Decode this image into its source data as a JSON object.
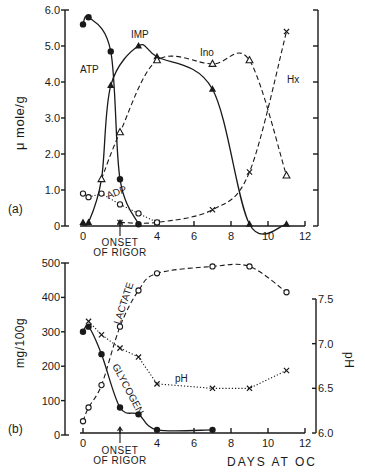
{
  "chart_data": [
    {
      "id": "a",
      "panel_label": "(a)",
      "type": "line",
      "xlabel": "",
      "ylabel": "μ mole/g",
      "xlim": [
        0,
        12
      ],
      "ylim": [
        0,
        6.0
      ],
      "x_ticks": [
        "0",
        "4",
        "6",
        "8",
        "10",
        "12"
      ],
      "y_ticks": [
        "0",
        "1.0",
        "2.0",
        "3.0",
        "4.0",
        "5.0",
        "6.0"
      ],
      "annotations": [
        {
          "text": "ONSET OF RIGOR",
          "x": 2
        }
      ],
      "series": [
        {
          "name": "ATP",
          "marker": "filled-circle",
          "line": "solid",
          "x": [
            0,
            0.3,
            1.5,
            2,
            3
          ],
          "y": [
            5.6,
            5.8,
            4.85,
            1.3,
            0.05
          ]
        },
        {
          "name": "IMP",
          "marker": "filled-triangle",
          "line": "solid",
          "x": [
            0,
            0.3,
            1,
            1.5,
            3,
            4,
            7,
            9,
            11
          ],
          "y": [
            0.1,
            0.1,
            1.3,
            3.9,
            5.0,
            4.7,
            3.8,
            0.05,
            0.05
          ]
        },
        {
          "name": "Ino",
          "marker": "open-triangle",
          "line": "dashed",
          "x": [
            1,
            2,
            4,
            7,
            9,
            11
          ],
          "y": [
            1.3,
            2.6,
            4.6,
            4.5,
            4.6,
            1.4
          ]
        },
        {
          "name": "Hx",
          "marker": "cross",
          "line": "dashed",
          "x": [
            2,
            4,
            7,
            9,
            11
          ],
          "y": [
            0.1,
            0.1,
            0.45,
            1.5,
            5.4
          ]
        },
        {
          "name": "ADP",
          "marker": "open-circle",
          "line": "dotted",
          "x": [
            0,
            0.3,
            1,
            2,
            3,
            4
          ],
          "y": [
            0.9,
            0.8,
            0.9,
            0.6,
            0.35,
            0.1
          ]
        }
      ]
    },
    {
      "id": "b",
      "panel_label": "(b)",
      "type": "line",
      "xlabel": "DAYS AT OC",
      "ylabel": "mg/100g",
      "y2label": "pH",
      "xlim": [
        0,
        12
      ],
      "ylim": [
        0,
        500
      ],
      "y2lim": [
        6.0,
        7.5
      ],
      "x_ticks": [
        "0",
        "4",
        "6",
        "8",
        "10",
        "12"
      ],
      "y_ticks": [
        "0",
        "100",
        "200",
        "300",
        "400",
        "500"
      ],
      "y2_ticks": [
        "6.0",
        "6.5",
        "7.0",
        "7.5"
      ],
      "annotations": [
        {
          "text": "ONSET OF RIGOR",
          "x": 2
        }
      ],
      "series": [
        {
          "name": "LACTATE",
          "marker": "open-circle",
          "line": "dashed",
          "axis": "left",
          "x": [
            0,
            0.3,
            1,
            2,
            3,
            4,
            7,
            9,
            11
          ],
          "y": [
            40,
            80,
            145,
            315,
            420,
            470,
            490,
            490,
            415
          ]
        },
        {
          "name": "GLYCOGEN",
          "marker": "filled-circle",
          "line": "solid",
          "axis": "left",
          "x": [
            0,
            0.3,
            1,
            2,
            3,
            4,
            7
          ],
          "y": [
            300,
            315,
            235,
            80,
            60,
            15,
            15
          ]
        },
        {
          "name": "pH",
          "marker": "cross",
          "line": "dotted",
          "axis": "right",
          "x": [
            0.3,
            1,
            2,
            3,
            4,
            7,
            9,
            11
          ],
          "y": [
            7.25,
            7.1,
            6.95,
            6.85,
            6.55,
            6.5,
            6.5,
            6.7
          ]
        }
      ]
    }
  ],
  "labels": {
    "a_panel": "(a)",
    "b_panel": "(b)",
    "a_ylabel": "μ mole/g",
    "b_ylabel": "mg/100g",
    "b_y2label": "pH",
    "xlabel": "DAYS AT OC",
    "onset_line1": "ONSET",
    "onset_line2": "OF RIGOR",
    "atp": "ATP",
    "imp": "IMP",
    "ino": "Ino",
    "hx": "Hx",
    "adp": "ADP",
    "lactate": "LACTATE",
    "glycogen": "GLYCOGEN",
    "ph": "pH"
  }
}
